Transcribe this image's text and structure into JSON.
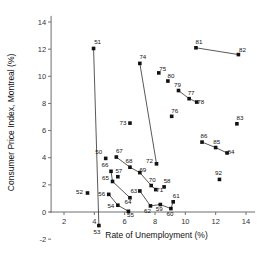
{
  "chart_data": {
    "type": "scatter",
    "title": "",
    "xlabel": "Rate of Unemployment (%)",
    "ylabel": "Consumer Price Index, Montreal (%)",
    "xlim": [
      0.8,
      14.8
    ],
    "ylim": [
      -2.2,
      14.6
    ],
    "xticks": [
      2,
      4,
      6,
      8,
      10,
      12,
      14
    ],
    "yticks": [
      -2,
      0,
      2,
      4,
      6,
      8,
      10,
      12,
      14
    ],
    "grid": false,
    "legend": "none",
    "points": [
      {
        "label": "50",
        "x": 4.75,
        "y": 3.95
      },
      {
        "label": "51",
        "x": 3.95,
        "y": 12.05
      },
      {
        "label": "52",
        "x": 3.55,
        "y": 1.4
      },
      {
        "label": "53",
        "x": 4.3,
        "y": -1.0
      },
      {
        "label": "54",
        "x": 5.55,
        "y": 0.5
      },
      {
        "label": "55",
        "x": 6.25,
        "y": 0.05
      },
      {
        "label": "56",
        "x": 4.95,
        "y": 1.3
      },
      {
        "label": "57",
        "x": 5.55,
        "y": 2.6
      },
      {
        "label": "58",
        "x": 8.6,
        "y": 1.85
      },
      {
        "label": "59",
        "x": 8.35,
        "y": 0.55
      },
      {
        "label": "60",
        "x": 9.05,
        "y": 0.25
      },
      {
        "label": "61",
        "x": 9.2,
        "y": 0.75
      },
      {
        "label": "62",
        "x": 7.7,
        "y": 0.45
      },
      {
        "label": "63",
        "x": 7.0,
        "y": 1.55
      },
      {
        "label": "64",
        "x": 6.35,
        "y": 1.05
      },
      {
        "label": "65",
        "x": 5.2,
        "y": 2.25
      },
      {
        "label": "66",
        "x": 5.1,
        "y": 3.0
      },
      {
        "label": "67",
        "x": 5.45,
        "y": 4.05
      },
      {
        "label": "68",
        "x": 6.35,
        "y": 3.3
      },
      {
        "label": "69",
        "x": 7.0,
        "y": 2.9
      },
      {
        "label": "70",
        "x": 7.75,
        "y": 1.95
      },
      {
        "label": "71",
        "x": 8.05,
        "y": 1.65
      },
      {
        "label": "72",
        "x": 8.1,
        "y": 3.55
      },
      {
        "label": "73",
        "x": 6.35,
        "y": 6.55
      },
      {
        "label": "74",
        "x": 7.0,
        "y": 10.95
      },
      {
        "label": "75",
        "x": 8.25,
        "y": 10.25
      },
      {
        "label": "76",
        "x": 9.1,
        "y": 7.05
      },
      {
        "label": "77",
        "x": 10.25,
        "y": 8.35
      },
      {
        "label": "78",
        "x": 10.75,
        "y": 8.1
      },
      {
        "label": "79",
        "x": 9.55,
        "y": 8.95
      },
      {
        "label": "80",
        "x": 8.85,
        "y": 9.65
      },
      {
        "label": "81",
        "x": 10.7,
        "y": 12.1
      },
      {
        "label": "82",
        "x": 13.5,
        "y": 11.6
      },
      {
        "label": "83",
        "x": 13.4,
        "y": 6.5
      },
      {
        "label": "84",
        "x": 12.75,
        "y": 4.35
      },
      {
        "label": "85",
        "x": 12.0,
        "y": 4.75
      },
      {
        "label": "86",
        "x": 11.1,
        "y": 5.15
      },
      {
        "label": "92",
        "x": 12.25,
        "y": 2.4
      }
    ],
    "connections": [
      [
        "51",
        "53"
      ],
      [
        "74",
        "72"
      ],
      [
        "79",
        "77"
      ],
      [
        "77",
        "78"
      ],
      [
        "81",
        "82"
      ],
      [
        "86",
        "85"
      ],
      [
        "85",
        "84"
      ],
      [
        "67",
        "68"
      ],
      [
        "68",
        "69"
      ],
      [
        "69",
        "70"
      ],
      [
        "70",
        "71"
      ],
      [
        "66",
        "65"
      ],
      [
        "65",
        "64"
      ],
      [
        "56",
        "54"
      ],
      [
        "54",
        "55"
      ],
      [
        "62",
        "63"
      ],
      [
        "59",
        "62"
      ],
      [
        "59",
        "60"
      ],
      [
        "60",
        "61"
      ]
    ],
    "label_offsets": {
      "50": [
        -7,
        -4
      ],
      "51": [
        4,
        -4
      ],
      "52": [
        -8,
        1
      ],
      "53": [
        -2,
        8
      ],
      "54": [
        -7,
        3
      ],
      "55": [
        2,
        6
      ],
      "56": [
        -7,
        2
      ],
      "57": [
        1,
        -4
      ],
      "58": [
        3,
        -4
      ],
      "59": [
        -1,
        6
      ],
      "60": [
        -1,
        7
      ],
      "61": [
        3,
        -4
      ],
      "62": [
        -3,
        7
      ],
      "63": [
        -6,
        2
      ],
      "64": [
        -2,
        6
      ],
      "65": [
        -7,
        -1
      ],
      "66": [
        -6,
        -4
      ],
      "67": [
        3,
        -4
      ],
      "68": [
        -1,
        -4
      ],
      "69": [
        3,
        -1
      ],
      "70": [
        1,
        -4
      ],
      "71": [
        4,
        2
      ],
      "72": [
        -7,
        -1
      ],
      "73": [
        -7,
        2
      ],
      "74": [
        3,
        -4
      ],
      "75": [
        4,
        -2
      ],
      "76": [
        3,
        -3
      ],
      "77": [
        2,
        -4
      ],
      "78": [
        4,
        2
      ],
      "79": [
        -1,
        -4
      ],
      "80": [
        3,
        -3
      ],
      "81": [
        3,
        -4
      ],
      "82": [
        4,
        -3
      ],
      "83": [
        3,
        -4
      ],
      "84": [
        4,
        1
      ],
      "85": [
        1,
        -4
      ],
      "86": [
        2,
        -4
      ],
      "92": [
        -1,
        -4
      ]
    }
  }
}
